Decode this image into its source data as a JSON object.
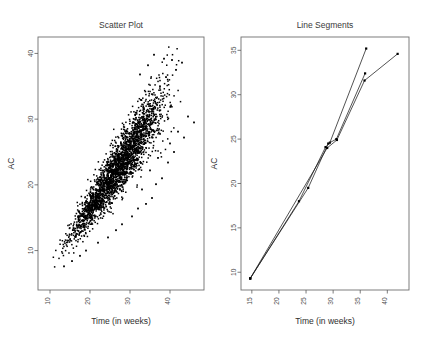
{
  "figure": {
    "width": 422,
    "height": 337,
    "background": "#ffffff",
    "point_color": "#000000",
    "line_color": "#1a1a1a",
    "frame_color": "#6f6f6f"
  },
  "chart_data": [
    {
      "type": "scatter",
      "title": "Scatter Plot",
      "xlabel": "Time (in weeks)",
      "ylabel": "AC",
      "xlim": [
        7.0,
        48.5
      ],
      "ylim": [
        4.0,
        42.5
      ],
      "xticks": [
        10,
        20,
        30,
        40
      ],
      "yticks": [
        10,
        20,
        30,
        40
      ],
      "xtick_labels": [
        "10",
        "20",
        "30",
        "40"
      ],
      "ytick_labels": [
        "10",
        "20",
        "30",
        "40"
      ],
      "grid": false,
      "legend": "none",
      "n_points": 2600,
      "description": "Dense positively correlated band of points rising from lower-left to upper-right, with a scattering of sparse outliers below and to the right of the main band.",
      "band": {
        "x_start": 10.0,
        "x_end": 44.0,
        "slope": 0.88,
        "intercept": -1.2,
        "spread_at_x_start": 0.85,
        "spread_at_x_end": 3.1,
        "x_density_peak": 26.0
      },
      "outliers": [
        [
          30.5,
          15.2
        ],
        [
          32.0,
          16.4
        ],
        [
          34.0,
          17.1
        ],
        [
          35.5,
          18.0
        ],
        [
          33.0,
          19.3
        ],
        [
          36.5,
          20.1
        ],
        [
          38.0,
          21.0
        ],
        [
          35.0,
          22.2
        ],
        [
          39.5,
          23.4
        ],
        [
          37.0,
          24.1
        ],
        [
          41.0,
          25.0
        ],
        [
          40.0,
          26.3
        ],
        [
          43.5,
          27.2
        ],
        [
          42.0,
          28.1
        ],
        [
          46.0,
          29.5
        ],
        [
          44.5,
          30.4
        ],
        [
          28.0,
          14.0
        ],
        [
          26.5,
          13.1
        ],
        [
          24.5,
          12.0
        ],
        [
          22.0,
          11.2
        ],
        [
          31.0,
          26.8
        ],
        [
          29.0,
          25.5
        ],
        [
          27.0,
          23.9
        ],
        [
          25.0,
          22.6
        ],
        [
          33.5,
          31.5
        ],
        [
          31.5,
          30.2
        ],
        [
          35.5,
          33.8
        ],
        [
          37.5,
          35.0
        ],
        [
          19.0,
          10.0
        ],
        [
          17.5,
          9.2
        ],
        [
          15.5,
          8.4
        ],
        [
          13.5,
          7.6
        ],
        [
          41.5,
          37.5
        ],
        [
          39.0,
          36.4
        ],
        [
          43.0,
          38.6
        ],
        [
          38.5,
          39.2
        ],
        [
          36.0,
          39.8
        ],
        [
          34.5,
          38.2
        ],
        [
          32.5,
          36.8
        ],
        [
          40.5,
          39.0
        ]
      ]
    },
    {
      "type": "line",
      "title": "Line Segments",
      "xlabel": "Time (in weeks)",
      "ylabel": "AC",
      "xlim": [
        13.0,
        44.0
      ],
      "ylim": [
        8.0,
        36.5
      ],
      "xticks": [
        15,
        20,
        25,
        30,
        35,
        40
      ],
      "yticks": [
        10,
        15,
        20,
        25,
        30,
        35
      ],
      "xtick_labels": [
        "15",
        "20",
        "25",
        "30",
        "35",
        "40"
      ],
      "ytick_labels": [
        "10",
        "15",
        "20",
        "25",
        "30",
        "35"
      ],
      "grid": false,
      "legend": "none",
      "markers": true,
      "description": "Three nearly-overlapping polylines all starting at the same lower-left point, crossing around (29, 24), then fanning out to three separate upper-right endpoints.",
      "series": [
        {
          "name": "trajectory-1",
          "points": [
            [
              14.7,
              9.3
            ],
            [
              23.7,
              18.0
            ],
            [
              28.6,
              24.1
            ],
            [
              29.4,
              24.6
            ],
            [
              36.1,
              35.2
            ]
          ]
        },
        {
          "name": "trajectory-2",
          "points": [
            [
              14.7,
              9.3
            ],
            [
              25.4,
              19.5
            ],
            [
              29.1,
              24.5
            ],
            [
              30.6,
              25.0
            ],
            [
              35.9,
              32.4
            ]
          ]
        },
        {
          "name": "trajectory-3",
          "points": [
            [
              14.7,
              9.3
            ],
            [
              28.9,
              24.0
            ],
            [
              30.7,
              24.9
            ],
            [
              35.8,
              31.6
            ],
            [
              41.9,
              34.6
            ]
          ]
        }
      ]
    }
  ]
}
